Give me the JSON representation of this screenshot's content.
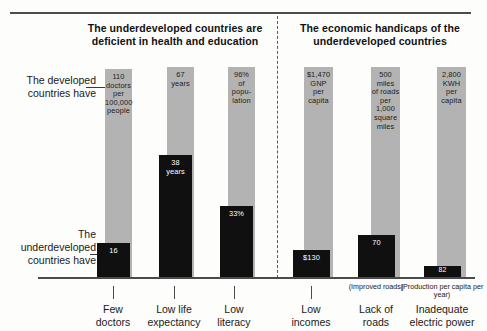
{
  "chart_data": {
    "type": "bar",
    "title": "",
    "panels": [
      {
        "id": "health-education",
        "title": "The underdeveloped countries are deficient in health and education"
      },
      {
        "id": "economic-handicaps",
        "title": "The economic handicaps of the underdeveloped countries"
      }
    ],
    "legend": [
      {
        "key": "developed",
        "label": "The developed countries have",
        "color": "#b3b3b3"
      },
      {
        "key": "underdeveloped",
        "label": "The underdeveloped countries have",
        "color": "#101010"
      }
    ],
    "series": [
      {
        "name": "The developed countries have",
        "color": "#b3b3b3",
        "values": [
          110,
          67,
          96,
          1470,
          500,
          2800
        ],
        "labels": [
          "110 doctors per 100,000 people",
          "67 years",
          "96% of popu- lation",
          "$1,470 GNP per capita",
          "500 miles of roads per 1,000 square miles",
          "2,800 KWH per capita"
        ]
      },
      {
        "name": "The underdeveloped countries have",
        "color": "#101010",
        "values": [
          16,
          38,
          33,
          130,
          70,
          82
        ],
        "labels": [
          "16",
          "38 years",
          "33%",
          "$130",
          "70",
          "82"
        ]
      }
    ],
    "categories": [
      "Few doctors",
      "Low life expectancy",
      "Low literacy",
      "Low incomes",
      "Lack of roads",
      "Inadequate electric power"
    ],
    "category_sublabels": [
      "",
      "",
      "",
      "",
      "(Improved roads)",
      "(Production per capita per year)"
    ],
    "xlabel": "",
    "ylabel": "",
    "grid": false,
    "legend_position": "left-side-annotations"
  },
  "bars": [
    {
      "id": "doctors",
      "category_line1": "Few",
      "category_line2": "doctors",
      "sublabel": "",
      "gray": {
        "lines": [
          "110",
          "doctors",
          "per",
          "100,000",
          "people"
        ],
        "left": 105,
        "width": 27,
        "top": 69
      },
      "dark": {
        "lines": [
          "16"
        ],
        "left": 97,
        "width": 33,
        "top": 243
      },
      "tick_x": 113,
      "label_x": 113
    },
    {
      "id": "life-expectancy",
      "category_line1": "Low life",
      "category_line2": "expectancy",
      "sublabel": "",
      "gray": {
        "lines": [
          "67",
          "years"
        ],
        "left": 167,
        "width": 27,
        "top": 67
      },
      "dark": {
        "lines": [
          "38",
          "years"
        ],
        "left": 159,
        "width": 33,
        "top": 155
      },
      "tick_x": 174,
      "label_x": 174
    },
    {
      "id": "literacy",
      "category_line1": "Low",
      "category_line2": "literacy",
      "sublabel": "",
      "gray": {
        "lines": [
          "96%",
          "of",
          "popu-",
          "lation"
        ],
        "left": 228,
        "width": 27,
        "top": 67
      },
      "dark": {
        "lines": [
          "33%"
        ],
        "left": 220,
        "width": 33,
        "top": 206
      },
      "tick_x": 234,
      "label_x": 234
    },
    {
      "id": "incomes",
      "category_line1": "Low",
      "category_line2": "incomes",
      "sublabel": "",
      "gray": {
        "lines": [
          "$1,470",
          "GNP",
          "per",
          "capita"
        ],
        "left": 304,
        "width": 29,
        "top": 67
      },
      "dark": {
        "lines": [
          "$130"
        ],
        "left": 293,
        "width": 37,
        "top": 250
      },
      "tick_x": 311,
      "label_x": 311
    },
    {
      "id": "roads",
      "category_line1": "Lack of",
      "category_line2": "roads",
      "sublabel": "(Improved roads)",
      "gray": {
        "lines": [
          "500",
          "miles",
          "of roads",
          "per",
          "1,000",
          "square",
          "miles"
        ],
        "left": 371,
        "width": 29,
        "top": 67
      },
      "dark": {
        "lines": [
          "70"
        ],
        "left": 358,
        "width": 37,
        "top": 235
      },
      "tick_x": 376,
      "label_x": 376
    },
    {
      "id": "electric-power",
      "category_line1": "Inadequate",
      "category_line2": "electric power",
      "sublabel": "(Production per capita per year)",
      "gray": {
        "lines": [
          "2,800",
          "KWH",
          "per",
          "capita"
        ],
        "left": 437,
        "width": 29,
        "top": 67
      },
      "dark": {
        "lines": [
          "82"
        ],
        "left": 424,
        "width": 37,
        "top": 266
      },
      "tick_x": 442,
      "label_x": 442
    }
  ],
  "titles": {
    "left": "The underdeveloped countries are deficient in health and education",
    "right": "The economic handicaps of the underdeveloped countries"
  },
  "side_labels": {
    "developed": "The developed countries have",
    "underdeveloped": "The underdeveloped countries have"
  },
  "colors": {
    "developed_bar": "#b3b3b3",
    "underdeveloped_bar": "#101010",
    "axis": "#4b4b4b",
    "background": "#fdfdfb"
  }
}
